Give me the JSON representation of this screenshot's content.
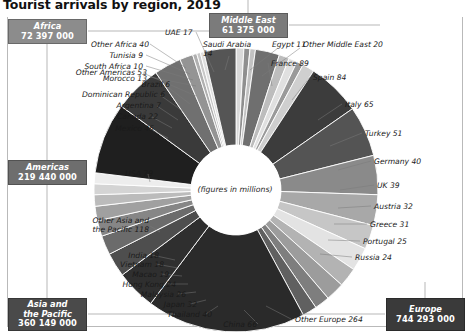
{
  "title": "Tourist arrivals by region, 2019",
  "center_note": "(figures in millions)",
  "colors": {
    "africa_box": "#8c8c8c",
    "middle_east_box": "#7b7b7b",
    "americas_box": "#6e6e6e",
    "asia_box": "#4a4a4a",
    "europe_box": "#3a3a3a",
    "frame": "#b9b9b9",
    "leader": "#9a9a9a",
    "text": "#1a1a1a"
  },
  "regions": [
    {
      "name": "Africa",
      "value": "72 397 000"
    },
    {
      "name": "Middle East",
      "value": "61 375 000"
    },
    {
      "name": "Americas",
      "value": "219 440 000"
    },
    {
      "name": "Asia and\nthe Pacific",
      "value": "360 149 000"
    },
    {
      "name": "Europe",
      "value": "744 293 000"
    }
  ],
  "region_boxes": {
    "africa": {
      "line1": "Africa",
      "value": "72 397 000"
    },
    "middle_east": {
      "line1": "Middle East",
      "value": "61 375 000"
    },
    "americas": {
      "line1": "Americas",
      "value": "219 440 000"
    },
    "asia": {
      "line1": "Asia and",
      "line2": "the Pacific",
      "value": "360 149 000"
    },
    "europe": {
      "line1": "Europe",
      "value": "744 293 000"
    }
  },
  "chart_data": {
    "type": "pie",
    "title": "Tourist arrivals by region, 2019",
    "subtitle": "(figures in millions)",
    "unit": "millions",
    "legend": "none",
    "categories": [
      "Morocco",
      "South Africa",
      "Tunisia",
      "Other Africa",
      "UAE",
      "Saudi Arabia",
      "Egypt",
      "Other Middle East",
      "France",
      "Spain",
      "Italy",
      "Turkey",
      "Germany",
      "UK",
      "Austria",
      "Greece",
      "Portugal",
      "Russia",
      "Other Europe",
      "China",
      "Thailand",
      "Japan",
      "Malaysia",
      "Hong Kong",
      "Macao",
      "Vietnam",
      "India",
      "Other Asia and the Pacific",
      "USA",
      "Mexico",
      "Canada",
      "Argentina",
      "Dominican Republic",
      "Brazil",
      "Other Americas"
    ],
    "values": [
      13,
      10,
      9,
      40,
      17,
      14,
      11,
      20,
      89,
      84,
      65,
      51,
      40,
      39,
      32,
      31,
      25,
      24,
      264,
      66,
      40,
      32,
      26,
      24,
      19,
      18,
      18,
      118,
      79,
      45,
      22,
      7,
      6,
      6,
      53
    ],
    "groups": [
      {
        "region": "Africa",
        "total_label": "72 397 000",
        "total_millions": 72,
        "items": [
          {
            "label": "Morocco 13",
            "name": "Morocco",
            "value": 13
          },
          {
            "label": "South Africa 10",
            "name": "South Africa",
            "value": 10
          },
          {
            "label": "Tunisia 9",
            "name": "Tunisia",
            "value": 9
          },
          {
            "label": "Other Africa 40",
            "name": "Other Africa",
            "value": 40
          }
        ]
      },
      {
        "region": "Middle East",
        "total_label": "61 375 000",
        "total_millions": 61,
        "items": [
          {
            "label": "UAE 17",
            "name": "UAE",
            "value": 17
          },
          {
            "label": "Saudi Arabia 14",
            "name": "Saudi Arabia",
            "value": 14
          },
          {
            "label": "Egypt 11",
            "name": "Egypt",
            "value": 11
          },
          {
            "label": "Other Middle East 20",
            "name": "Other Middle East",
            "value": 20
          }
        ]
      },
      {
        "region": "Europe",
        "total_label": "744 293 000",
        "total_millions": 744,
        "items": [
          {
            "label": "France 89",
            "name": "France",
            "value": 89
          },
          {
            "label": "Spain 84",
            "name": "Spain",
            "value": 84
          },
          {
            "label": "Italy 65",
            "name": "Italy",
            "value": 65
          },
          {
            "label": "Turkey 51",
            "name": "Turkey",
            "value": 51
          },
          {
            "label": "Germany 40",
            "name": "Germany",
            "value": 40
          },
          {
            "label": "UK 39",
            "name": "UK",
            "value": 39
          },
          {
            "label": "Austria 32",
            "name": "Austria",
            "value": 32
          },
          {
            "label": "Greece 31",
            "name": "Greece",
            "value": 31
          },
          {
            "label": "Portugal 25",
            "name": "Portugal",
            "value": 25
          },
          {
            "label": "Russia 24",
            "name": "Russia",
            "value": 24
          },
          {
            "label": "Other Europe 264",
            "name": "Other Europe",
            "value": 264
          }
        ]
      },
      {
        "region": "Asia and the Pacific",
        "total_label": "360 149 000",
        "total_millions": 360,
        "items": [
          {
            "label": "China 66",
            "name": "China",
            "value": 66
          },
          {
            "label": "Thailand 40",
            "name": "Thailand",
            "value": 40
          },
          {
            "label": "Japan 32",
            "name": "Japan",
            "value": 32
          },
          {
            "label": "Malaysia 26",
            "name": "Malaysia",
            "value": 26
          },
          {
            "label": "Hong Kong 24",
            "name": "Hong Kong",
            "value": 24
          },
          {
            "label": "Macao 19",
            "name": "Macao",
            "value": 19
          },
          {
            "label": "Vietnam 18",
            "name": "Vietnam",
            "value": 18
          },
          {
            "label": "India 18",
            "name": "India",
            "value": 18
          },
          {
            "label": "Other Asia and the Pacific 118",
            "name": "Other Asia and the Pacific",
            "value": 118
          }
        ]
      },
      {
        "region": "Americas",
        "total_label": "219 440 000",
        "total_millions": 219,
        "items": [
          {
            "label": "USA 79",
            "name": "USA",
            "value": 79
          },
          {
            "label": "Mexico 45",
            "name": "Mexico",
            "value": 45
          },
          {
            "label": "Canada 22",
            "name": "Canada",
            "value": 22
          },
          {
            "label": "Argentina 7",
            "name": "Argentina",
            "value": 7
          },
          {
            "label": "Dominican Republic 6",
            "name": "Dominican Republic",
            "value": 6
          },
          {
            "label": "Brazil 6",
            "name": "Brazil",
            "value": 6
          },
          {
            "label": "Other Americas 53",
            "name": "Other Americas",
            "value": 53
          }
        ]
      }
    ]
  },
  "labels": {
    "morocco": "Morocco 13",
    "south_africa": "South Africa 10",
    "tunisia": "Tunisia 9",
    "other_africa": "Other Africa 40",
    "uae": "UAE 17",
    "saudi_arabia_1": "Saudi Arabia",
    "saudi_arabia_2": "14",
    "egypt": "Egypt 11",
    "other_middle_east": "Other Middle East 20",
    "france": "France 89",
    "spain": "Spain 84",
    "italy": "Italy 65",
    "turkey": "Turkey 51",
    "germany": "Germany 40",
    "uk": "UK 39",
    "austria": "Austria 32",
    "greece": "Greece 31",
    "portugal": "Portugal 25",
    "russia": "Russia 24",
    "other_europe": "Other Europe 264",
    "china": "China 66",
    "thailand": "Thailand 40",
    "japan": "Japan 32",
    "malaysia": "Malaysia 26",
    "hong_kong": "Hong Kong 24",
    "macao": "Macao 19",
    "vietnam": "Vietnam 18",
    "india": "India 18",
    "other_asia_1": "Other Asia and",
    "other_asia_2": "the Pacific 118",
    "usa": "USA 79",
    "mexico": "Mexico 45",
    "canada": "Canada 22",
    "argentina": "Argentina 7",
    "dominican_republic": "Dominican Republic 6",
    "brazil": "Brazil 6",
    "other_americas": "Other Americas 53"
  }
}
